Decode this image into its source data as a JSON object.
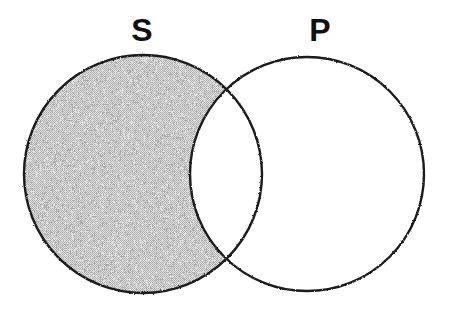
{
  "diagram": {
    "type": "venn-two-circle",
    "title": "",
    "background_color": "#ffffff",
    "stroke_color": "#1a1a1a",
    "stroke_width": 2,
    "shade_color": "#c8c8c8",
    "shade_pattern": "dithered-gray-checkerboard",
    "labels": {
      "left_label": "S",
      "right_label": "P"
    },
    "circles": [
      {
        "name": "subject-circle",
        "label": "S",
        "cx": 143,
        "cy": 174,
        "r": 119,
        "filled": false
      },
      {
        "name": "predicate-circle",
        "label": "P",
        "cx": 307,
        "cy": 174,
        "r": 117,
        "filled": false
      }
    ],
    "shaded_regions": [
      {
        "name": "s-not-p",
        "description": "S only",
        "shaded": true
      },
      {
        "name": "s-and-p",
        "description": "S intersect P",
        "shaded": false
      },
      {
        "name": "p-not-s",
        "description": "P only",
        "shaded": false
      }
    ],
    "intersection_points": [
      {
        "x": 226,
        "y": 93
      },
      {
        "x": 226,
        "y": 258
      }
    ]
  }
}
